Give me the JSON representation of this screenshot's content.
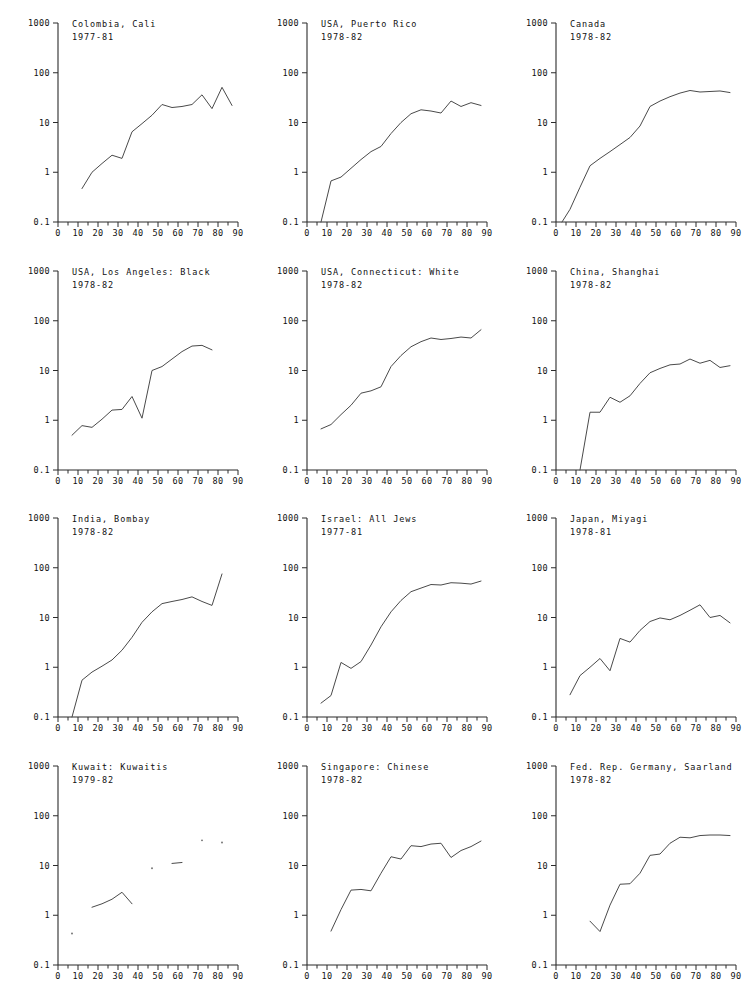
{
  "figure": {
    "kind": "small-multiples",
    "rows": 4,
    "cols": 3,
    "background": "#ffffff",
    "line_color": "#4a4a4a",
    "axis_color": "#2b2b2b"
  },
  "axes_common": {
    "x": {
      "label": "",
      "min": 0,
      "max": 90,
      "ticks_major": [
        0,
        10,
        20,
        30,
        40,
        50,
        60,
        70,
        80,
        90
      ],
      "ticks_minor_step": 5,
      "tick_labels": [
        "0",
        "10",
        "20",
        "30",
        "40",
        "50",
        "60",
        "70",
        "80",
        "90"
      ]
    },
    "y": {
      "label": "",
      "scale": "log",
      "min": 0.1,
      "max": 1000,
      "ticks": [
        0.1,
        1,
        10,
        100,
        1000
      ],
      "tick_labels": [
        "0.1",
        "1",
        "10",
        "100",
        "1000"
      ]
    },
    "grid": false,
    "legend": "none"
  },
  "chart_data": [
    {
      "type": "line",
      "title": "Colombia, Cali",
      "subtitle": "1977-81",
      "xlabel": "",
      "ylabel": "",
      "xlim": [
        0,
        90
      ],
      "ylim": [
        0.1,
        1000
      ],
      "yscale": "log",
      "grid": false,
      "legend": "none",
      "x": [
        12,
        17,
        22,
        27,
        32,
        37,
        42,
        47,
        52,
        57,
        62,
        67,
        72,
        77,
        82,
        87
      ],
      "values": [
        0.47,
        1.0,
        1.5,
        2.2,
        1.9,
        6.5,
        9.5,
        14.0,
        23.0,
        20.0,
        21.0,
        23.0,
        36.0,
        19.0,
        51.0,
        22.0
      ]
    },
    {
      "type": "line",
      "title": "USA, Puerto Rico",
      "subtitle": "1978-82",
      "xlabel": "",
      "ylabel": "",
      "xlim": [
        0,
        90
      ],
      "ylim": [
        0.1,
        1000
      ],
      "yscale": "log",
      "grid": false,
      "legend": "none",
      "x": [
        7,
        12,
        17,
        22,
        27,
        32,
        37,
        42,
        47,
        52,
        57,
        62,
        67,
        72,
        77,
        82,
        87
      ],
      "values": [
        0.1,
        0.67,
        0.8,
        1.2,
        1.8,
        2.6,
        3.3,
        6.0,
        10.0,
        15.0,
        18.0,
        17.0,
        15.5,
        27.0,
        21.0,
        25.0,
        22.0
      ]
    },
    {
      "type": "line",
      "title": "Canada",
      "subtitle": "1978-82",
      "xlabel": "",
      "ylabel": "",
      "xlim": [
        0,
        90
      ],
      "ylim": [
        0.1,
        1000
      ],
      "yscale": "log",
      "grid": false,
      "legend": "none",
      "x": [
        3,
        7,
        12,
        17,
        22,
        27,
        32,
        37,
        42,
        47,
        52,
        57,
        62,
        67,
        72,
        77,
        82,
        87
      ],
      "values": [
        0.1,
        0.18,
        0.5,
        1.35,
        1.9,
        2.6,
        3.6,
        5.0,
        8.5,
        21.0,
        27.0,
        33.0,
        39.0,
        44.0,
        41.0,
        42.0,
        43.0,
        40.0
      ]
    },
    {
      "type": "line",
      "title": "USA, Los Angeles: Black",
      "subtitle": "1978-82",
      "xlabel": "",
      "ylabel": "",
      "xlim": [
        0,
        90
      ],
      "ylim": [
        0.1,
        1000
      ],
      "yscale": "log",
      "grid": false,
      "legend": "none",
      "x": [
        7,
        12,
        17,
        22,
        27,
        32,
        37,
        42,
        47,
        52,
        57,
        62,
        67,
        72,
        77
      ],
      "values": [
        0.5,
        0.78,
        0.72,
        1.05,
        1.6,
        1.65,
        3.0,
        1.1,
        10.0,
        12.0,
        17.0,
        24.0,
        31.0,
        32.0,
        26.0,
        40.0
      ]
    },
    {
      "type": "line",
      "title": "USA, Connecticut: White",
      "subtitle": "1978-82",
      "xlabel": "",
      "ylabel": "",
      "xlim": [
        0,
        90
      ],
      "ylim": [
        0.1,
        1000
      ],
      "yscale": "log",
      "grid": false,
      "legend": "none",
      "x": [
        7,
        12,
        17,
        22,
        27,
        32,
        37,
        42,
        47,
        52,
        57,
        62,
        67,
        72,
        77,
        82,
        87
      ],
      "values": [
        0.67,
        0.82,
        1.3,
        2.0,
        3.5,
        3.9,
        4.7,
        12.0,
        20.0,
        30.0,
        38.0,
        45.0,
        42.0,
        44.0,
        47.0,
        45.0,
        66.0,
        43.0
      ]
    },
    {
      "type": "line",
      "title": "China, Shanghai",
      "subtitle": "1978-82",
      "xlabel": "",
      "ylabel": "",
      "xlim": [
        0,
        90
      ],
      "ylim": [
        0.1,
        1000
      ],
      "yscale": "log",
      "grid": false,
      "legend": "none",
      "x": [
        12,
        17,
        22,
        27,
        32,
        37,
        42,
        47,
        52,
        57,
        62,
        67,
        72,
        77,
        82,
        87
      ],
      "values": [
        0.1,
        1.45,
        1.45,
        2.9,
        2.3,
        3.1,
        5.5,
        9.0,
        11.0,
        13.0,
        13.5,
        17.0,
        14.0,
        16.0,
        11.5,
        12.5
      ]
    },
    {
      "type": "line",
      "title": "India, Bombay",
      "subtitle": "1978-82",
      "xlabel": "",
      "ylabel": "",
      "xlim": [
        0,
        90
      ],
      "ylim": [
        0.1,
        1000
      ],
      "yscale": "log",
      "grid": false,
      "legend": "none",
      "x": [
        7,
        12,
        17,
        22,
        27,
        32,
        37,
        42,
        47,
        52,
        57,
        62,
        67,
        72,
        77,
        82
      ],
      "values": [
        0.1,
        0.55,
        0.8,
        1.05,
        1.4,
        2.2,
        4.0,
        8.0,
        13.0,
        19.0,
        21.0,
        23.0,
        26.0,
        21.0,
        17.5,
        75.0
      ]
    },
    {
      "type": "line",
      "title": "Israel: All Jews",
      "subtitle": "1977-81",
      "xlabel": "",
      "ylabel": "",
      "xlim": [
        0,
        90
      ],
      "ylim": [
        0.1,
        1000
      ],
      "yscale": "log",
      "grid": false,
      "legend": "none",
      "x": [
        7,
        12,
        17,
        22,
        27,
        32,
        37,
        42,
        47,
        52,
        57,
        62,
        67,
        72,
        77,
        82,
        87
      ],
      "values": [
        0.19,
        0.27,
        1.25,
        0.95,
        1.3,
        2.8,
        6.5,
        13.0,
        22.0,
        33.0,
        39.0,
        46.0,
        45.0,
        50.0,
        49.0,
        47.0,
        54.0,
        43.0
      ]
    },
    {
      "type": "line",
      "title": "Japan, Miyagi",
      "subtitle": "1978-81",
      "xlabel": "",
      "ylabel": "",
      "xlim": [
        0,
        90
      ],
      "ylim": [
        0.1,
        1000
      ],
      "yscale": "log",
      "grid": false,
      "legend": "none",
      "x": [
        7,
        12,
        17,
        22,
        27,
        32,
        37,
        42,
        47,
        52,
        57,
        62,
        67,
        72,
        77,
        82,
        87
      ],
      "values": [
        0.28,
        0.68,
        1.0,
        1.5,
        0.85,
        3.8,
        3.2,
        5.5,
        8.3,
        9.8,
        9.0,
        11.0,
        14.0,
        18.0,
        10.0,
        11.0,
        7.8
      ]
    },
    {
      "type": "line",
      "title": "Kuwait: Kuwaitis",
      "subtitle": "1979-82",
      "xlabel": "",
      "ylabel": "",
      "xlim": [
        0,
        90
      ],
      "ylim": [
        0.1,
        1000
      ],
      "yscale": "log",
      "grid": false,
      "legend": "none",
      "segments": [
        {
          "x": [
            17,
            22,
            27,
            32,
            37
          ],
          "values": [
            1.45,
            1.7,
            2.1,
            2.9,
            1.7
          ]
        },
        {
          "x": [
            57,
            62
          ],
          "values": [
            11.0,
            11.5
          ]
        }
      ],
      "points": [
        {
          "x": 7,
          "value": 0.43
        },
        {
          "x": 47,
          "value": 8.8
        },
        {
          "x": 72,
          "value": 32.0
        },
        {
          "x": 82,
          "value": 29.0
        }
      ]
    },
    {
      "type": "line",
      "title": "Singapore: Chinese",
      "subtitle": "1978-82",
      "xlabel": "",
      "ylabel": "",
      "xlim": [
        0,
        90
      ],
      "ylim": [
        0.1,
        1000
      ],
      "yscale": "log",
      "grid": false,
      "legend": "none",
      "x": [
        12,
        17,
        22,
        27,
        32,
        37,
        42,
        47,
        52,
        57,
        62,
        67,
        72,
        77,
        82,
        87
      ],
      "values": [
        0.48,
        1.3,
        3.2,
        3.3,
        3.1,
        7.0,
        15.0,
        13.5,
        25.0,
        24.0,
        27.0,
        28.0,
        14.5,
        20.0,
        24.0,
        31.0
      ]
    },
    {
      "type": "line",
      "title": "Fed. Rep. Germany, Saarland",
      "subtitle": "1978-82",
      "xlabel": "",
      "ylabel": "",
      "xlim": [
        0,
        90
      ],
      "ylim": [
        0.1,
        1000
      ],
      "yscale": "log",
      "grid": false,
      "legend": "none",
      "x": [
        17,
        22,
        27,
        32,
        37,
        42,
        47,
        52,
        57,
        62,
        67,
        72,
        77,
        82,
        87
      ],
      "values": [
        0.76,
        0.47,
        1.6,
        4.2,
        4.3,
        7.0,
        16.0,
        17.0,
        28.0,
        37.0,
        36.0,
        40.0,
        41.0,
        41.0,
        40.0
      ]
    }
  ]
}
